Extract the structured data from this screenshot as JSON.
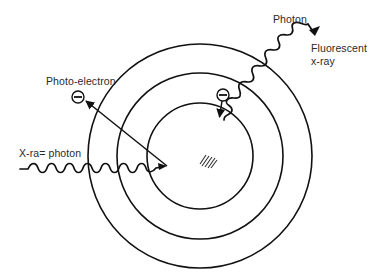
{
  "diagram": {
    "type": "photoelectric-absorption-and-fluorescence",
    "labels": {
      "photo_electron": "Photo-electron",
      "xray_photon": "X-ra= photon",
      "photon": "Photon",
      "fluorescent_line1": "Fluorescent",
      "fluorescent_line2": "x-ray"
    },
    "atom": {
      "center": [
        200,
        156
      ],
      "shells": [
        {
          "name": "inner-shell",
          "radius": 53
        },
        {
          "name": "middle-shell",
          "radius": 83
        },
        {
          "name": "outer-shell",
          "radius": 112
        }
      ],
      "nucleus": {
        "symbol": "hatched-nucleus",
        "position": [
          209,
          161
        ]
      }
    },
    "electrons": [
      {
        "name": "ejected-photo-electron",
        "symbol": "minus-in-circle",
        "position": [
          78,
          97
        ]
      },
      {
        "name": "transitioning-electron",
        "symbol": "minus-in-circle",
        "position": [
          223,
          95
        ]
      }
    ],
    "arrows": [
      {
        "name": "photo-electron-ejection-arrow",
        "from": [
          167,
          166
        ],
        "to": [
          84,
          101
        ]
      },
      {
        "name": "electron-transition-arrow",
        "from": [
          222,
          101
        ],
        "to": [
          219,
          117
        ]
      }
    ],
    "waves": [
      {
        "name": "incident-xray-wave",
        "from": [
          20,
          169
        ],
        "to": [
          162,
          168
        ]
      },
      {
        "name": "fluorescent-xray-wave",
        "from": [
          224,
          120
        ],
        "to": [
          318,
          27
        ]
      }
    ],
    "colors": {
      "ink": "#111111",
      "text": "#2a2a2a",
      "background": "#ffffff"
    }
  }
}
